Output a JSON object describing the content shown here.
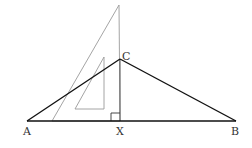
{
  "diagram": {
    "type": "geometry",
    "colors": {
      "triangle": "#111111",
      "set_square": "#9a9a9a",
      "label": "#333333",
      "background": "#ffffff"
    },
    "points": {
      "A": {
        "label": "A",
        "x": 27,
        "y": 121
      },
      "B": {
        "label": "B",
        "x": 236,
        "y": 121
      },
      "C": {
        "label": "C",
        "x": 120,
        "y": 59
      },
      "X": {
        "label": "X",
        "x": 120,
        "y": 121
      }
    },
    "labels": {
      "A": "A",
      "B": "B",
      "C": "C",
      "X": "X"
    },
    "set_square": {
      "outer": [
        [
          119,
          5
        ],
        [
          120,
          121
        ],
        [
          52,
          121
        ]
      ],
      "inner_cutout": [
        [
          104,
          57
        ],
        [
          104,
          109
        ],
        [
          75,
          109
        ]
      ]
    },
    "right_angle_marker": {
      "at": "X",
      "size": 9
    }
  }
}
